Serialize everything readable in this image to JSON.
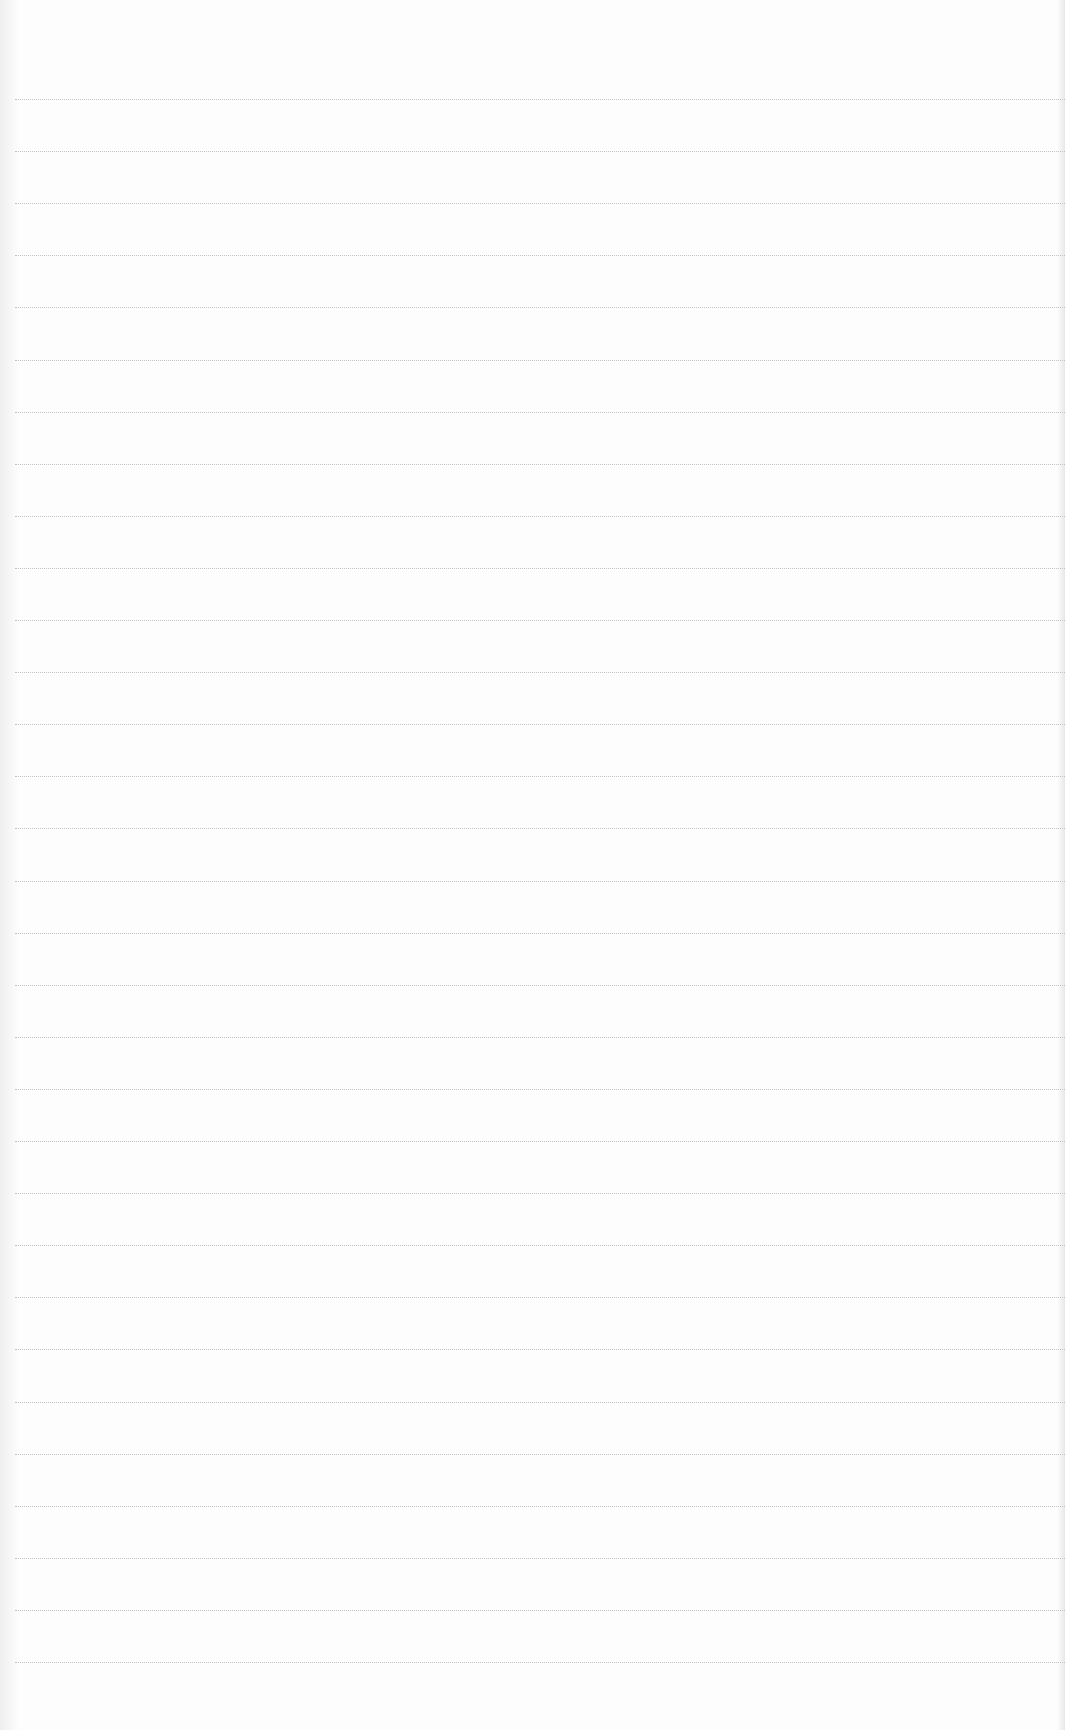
{
  "page": {
    "type": "blank-ruled-paper",
    "line_count": 31,
    "first_line_y": 99,
    "line_spacing": 52.1,
    "line_color": "#b9b9b9",
    "paper_color": "#fdfdfd"
  }
}
